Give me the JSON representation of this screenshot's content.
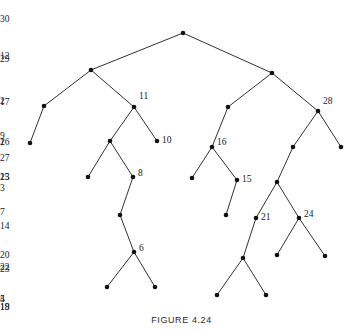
{
  "figure": {
    "caption": "FIGURE 4.24",
    "width": 363,
    "height": 333,
    "background_color": "#ffffff",
    "node_color": "#111111",
    "edge_color": "#1a1a1a"
  },
  "chart_data": {
    "type": "diagram",
    "diagram_kind": "binary-tree",
    "title": "FIGURE 4.24",
    "xlabel": "",
    "ylabel": "",
    "grid": false,
    "legend": null,
    "root": "30",
    "node_count": 30,
    "nodes": [
      {
        "id": "30",
        "label": "30",
        "x": 183,
        "y": 33,
        "label_dx": -3,
        "label_dy": -13,
        "label_anchor": "end"
      },
      {
        "id": "12",
        "label": "12",
        "x": 91,
        "y": 70,
        "label_dx": -5,
        "label_dy": -13,
        "label_anchor": "end"
      },
      {
        "id": "29",
        "label": "29",
        "x": 272,
        "y": 73,
        "label_dx": -4,
        "label_dy": -13,
        "label_anchor": "end"
      },
      {
        "id": "2",
        "label": "2",
        "x": 44,
        "y": 106,
        "label_dx": -5,
        "label_dy": -4,
        "label_anchor": "end"
      },
      {
        "id": "11",
        "label": "11",
        "x": 134,
        "y": 107,
        "label_dx": 5,
        "label_dy": -10,
        "label_anchor": "start"
      },
      {
        "id": "17",
        "label": "17",
        "x": 228,
        "y": 107,
        "label_dx": -5,
        "label_dy": -4,
        "label_anchor": "end"
      },
      {
        "id": "28",
        "label": "28",
        "x": 318,
        "y": 111,
        "label_dx": 5,
        "label_dy": -9,
        "label_anchor": "start"
      },
      {
        "id": "1",
        "label": "1",
        "x": 30,
        "y": 143,
        "label_dx": -5,
        "label_dy": 0,
        "label_anchor": "end"
      },
      {
        "id": "9",
        "label": "9",
        "x": 110,
        "y": 141,
        "label_dx": -5,
        "label_dy": -4,
        "label_anchor": "end"
      },
      {
        "id": "10",
        "label": "10",
        "x": 157,
        "y": 141,
        "label_dx": 5,
        "label_dy": 0,
        "label_anchor": "start"
      },
      {
        "id": "16",
        "label": "16",
        "x": 212,
        "y": 147,
        "label_dx": 5,
        "label_dy": -4,
        "label_anchor": "start"
      },
      {
        "id": "26",
        "label": "26",
        "x": 293,
        "y": 147,
        "label_dx": -5,
        "label_dy": -4,
        "label_anchor": "end"
      },
      {
        "id": "27",
        "label": "27",
        "x": 341,
        "y": 147,
        "label_dx": -2,
        "label_dy": 12,
        "label_anchor": "end"
      },
      {
        "id": "3",
        "label": "3",
        "x": 88,
        "y": 177,
        "label_dx": -1,
        "label_dy": 12,
        "label_anchor": "end"
      },
      {
        "id": "8",
        "label": "8",
        "x": 133,
        "y": 177,
        "label_dx": 5,
        "label_dy": -3,
        "label_anchor": "start"
      },
      {
        "id": "13",
        "label": "13",
        "x": 192,
        "y": 178,
        "label_dx": -5,
        "label_dy": 0,
        "label_anchor": "end"
      },
      {
        "id": "15",
        "label": "15",
        "x": 237,
        "y": 180,
        "label_dx": 5,
        "label_dy": 0,
        "label_anchor": "start"
      },
      {
        "id": "25",
        "label": "25",
        "x": 277,
        "y": 182,
        "label_dx": -5,
        "label_dy": -4,
        "label_anchor": "end"
      },
      {
        "id": "7",
        "label": "7",
        "x": 120,
        "y": 215,
        "label_dx": -5,
        "label_dy": -2,
        "label_anchor": "end"
      },
      {
        "id": "14",
        "label": "14",
        "x": 226,
        "y": 215,
        "label_dx": -1,
        "label_dy": 12,
        "label_anchor": "end"
      },
      {
        "id": "21",
        "label": "21",
        "x": 256,
        "y": 218,
        "label_dx": 5,
        "label_dy": 0,
        "label_anchor": "start"
      },
      {
        "id": "24",
        "label": "24",
        "x": 299,
        "y": 218,
        "label_dx": 5,
        "label_dy": -3,
        "label_anchor": "start"
      },
      {
        "id": "6",
        "label": "6",
        "x": 134,
        "y": 252,
        "label_dx": 5,
        "label_dy": -3,
        "label_anchor": "start"
      },
      {
        "id": "22",
        "label": "22",
        "x": 277,
        "y": 255,
        "label_dx": -1,
        "label_dy": 13,
        "label_anchor": "end"
      },
      {
        "id": "23",
        "label": "23",
        "x": 325,
        "y": 256,
        "label_dx": -1,
        "label_dy": 14,
        "label_anchor": "end"
      },
      {
        "id": "20",
        "label": "20",
        "x": 243,
        "y": 258,
        "label_dx": -5,
        "label_dy": -2,
        "label_anchor": "end"
      },
      {
        "id": "4",
        "label": "4",
        "x": 107,
        "y": 287,
        "label_dx": -1,
        "label_dy": 13,
        "label_anchor": "end"
      },
      {
        "id": "5",
        "label": "5",
        "x": 155,
        "y": 287,
        "label_dx": -1,
        "label_dy": 13,
        "label_anchor": "end"
      },
      {
        "id": "18",
        "label": "18",
        "x": 217,
        "y": 295,
        "label_dx": -1,
        "label_dy": 13,
        "label_anchor": "end"
      },
      {
        "id": "19",
        "label": "19",
        "x": 266,
        "y": 295,
        "label_dx": -1,
        "label_dy": 13,
        "label_anchor": "end"
      }
    ],
    "edges": [
      {
        "from": "30",
        "to": "12"
      },
      {
        "from": "30",
        "to": "29"
      },
      {
        "from": "12",
        "to": "2"
      },
      {
        "from": "12",
        "to": "11"
      },
      {
        "from": "2",
        "to": "1"
      },
      {
        "from": "11",
        "to": "9"
      },
      {
        "from": "11",
        "to": "10"
      },
      {
        "from": "9",
        "to": "3"
      },
      {
        "from": "9",
        "to": "8"
      },
      {
        "from": "8",
        "to": "7"
      },
      {
        "from": "7",
        "to": "6"
      },
      {
        "from": "6",
        "to": "4"
      },
      {
        "from": "6",
        "to": "5"
      },
      {
        "from": "29",
        "to": "17"
      },
      {
        "from": "29",
        "to": "28"
      },
      {
        "from": "17",
        "to": "16"
      },
      {
        "from": "16",
        "to": "13"
      },
      {
        "from": "16",
        "to": "15"
      },
      {
        "from": "15",
        "to": "14"
      },
      {
        "from": "28",
        "to": "26"
      },
      {
        "from": "28",
        "to": "27"
      },
      {
        "from": "26",
        "to": "25"
      },
      {
        "from": "25",
        "to": "21"
      },
      {
        "from": "25",
        "to": "24"
      },
      {
        "from": "21",
        "to": "20"
      },
      {
        "from": "20",
        "to": "18"
      },
      {
        "from": "20",
        "to": "19"
      },
      {
        "from": "24",
        "to": "22"
      },
      {
        "from": "24",
        "to": "23"
      }
    ]
  }
}
